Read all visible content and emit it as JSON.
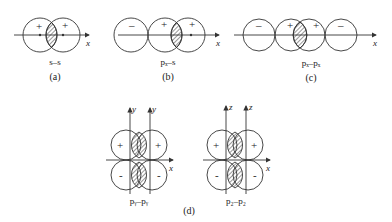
{
  "panels": {
    "a": {
      "orbital_label": "s–s",
      "panel_label": "(a)",
      "axis_label": "x",
      "signs": [
        "+",
        "+"
      ]
    },
    "b": {
      "orbital_label": "pₓ–s",
      "panel_label": "(b)",
      "axis_label": "x",
      "signs": [
        "–",
        "+",
        "+"
      ]
    },
    "c": {
      "orbital_label": "pₓ–pₓ",
      "panel_label": "(c)",
      "axis_label": "x",
      "signs": [
        "–",
        "+",
        "+",
        "–"
      ]
    },
    "d": {
      "panel_label": "(d)",
      "py": {
        "orbital_label": "pᵧ–pᵧ",
        "axis_x": "x",
        "axis_vertical": [
          "y",
          "y"
        ],
        "signs_top": [
          "+",
          "+"
        ],
        "signs_bottom": [
          "-",
          "-"
        ]
      },
      "pz": {
        "orbital_label": "p_z–p_z",
        "display_label": "p₂–p₂",
        "axis_x": "x",
        "axis_vertical": [
          "z",
          "z"
        ],
        "signs_top": [
          "+",
          "+"
        ],
        "signs_bottom": [
          "-",
          "-"
        ]
      }
    }
  },
  "colors": {
    "stroke": "#333333",
    "text": "#222222"
  }
}
